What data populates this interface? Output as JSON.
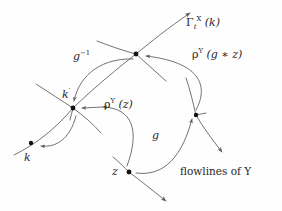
{
  "figure": {
    "background_color": "#fefefe",
    "stroke_color": "#5a5a5a",
    "point_color": "#111111",
    "text_color": "#262626",
    "width": 282,
    "height": 211
  },
  "labels": {
    "gamma_flow": {
      "gamma": "Γ",
      "sub": "t",
      "sup": "X",
      "arg": "(k)",
      "plain": "Γ_t^X (k)"
    },
    "g_inverse": {
      "base": "g",
      "sup": "−1",
      "plain": "g⁻¹"
    },
    "rho_g_star_z": {
      "rho": "ρ",
      "sub": "Y",
      "arg": "(g ∗ z)",
      "plain": "ρ_Y (g ∗ z)"
    },
    "rho_z": {
      "rho": "ρ",
      "sub": "Y",
      "arg": "(z)",
      "plain": "ρ_Y (z)"
    },
    "point_k_prime": {
      "base": "k",
      "prime": "′",
      "plain": "k′"
    },
    "point_k": {
      "base": "k",
      "plain": "k"
    },
    "point_z": {
      "base": "z",
      "plain": "z"
    },
    "group_element_g": {
      "base": "g",
      "plain": "g"
    },
    "flowlines_caption": "flowlines of Y"
  },
  "points": [
    {
      "name": "k",
      "x": 31,
      "y": 143
    },
    {
      "name": "k-prime",
      "x": 73,
      "y": 108
    },
    {
      "name": "top-node",
      "x": 136,
      "y": 54
    },
    {
      "name": "g-star-z",
      "x": 196,
      "y": 115
    },
    {
      "name": "z",
      "x": 129,
      "y": 172
    }
  ],
  "flowlines": [
    {
      "name": "flowline-through-k-prime",
      "arrow": "none"
    },
    {
      "name": "flowline-through-top-node",
      "arrow": "none"
    },
    {
      "name": "flowline-k-to-top-arrow",
      "arrow": "end"
    },
    {
      "name": "flowline-through-g-star-z",
      "arrow": "end"
    },
    {
      "name": "flowline-through-z",
      "arrow": "end"
    }
  ],
  "arrows": [
    {
      "name": "arrow-g-inverse",
      "from": "top-node",
      "to": "k-prime"
    },
    {
      "name": "arrow-rho-g-star-z",
      "from": "g-star-z",
      "to": "top-node"
    },
    {
      "name": "arrow-rho-z",
      "from": "z",
      "to": "k-prime"
    },
    {
      "name": "arrow-g",
      "from": "z",
      "to": "g-star-z"
    },
    {
      "name": "arrow-k-prime-to-k",
      "from": "k-prime",
      "to": "k"
    }
  ]
}
